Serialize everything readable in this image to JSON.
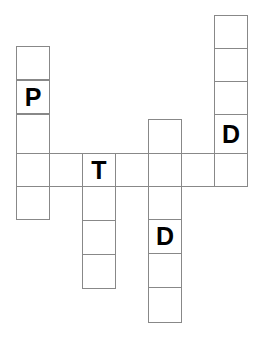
{
  "puzzle": {
    "title": "Crossword Grid",
    "background_color": "#ffffff",
    "cell_border_color": "#888888",
    "cell_fill_color": "#ffffff",
    "letter_color": "#000000",
    "cell_size": 33,
    "canvas": {
      "width": 260,
      "height": 343
    }
  },
  "entries": [
    {
      "name": "down-entry-left-p",
      "direction": "down",
      "length": 5,
      "letters": [
        "",
        "P",
        "",
        "",
        ""
      ],
      "x": 16,
      "y": 46
    },
    {
      "name": "down-entry-top-right-d",
      "direction": "down",
      "length": 5,
      "letters": [
        "",
        "",
        "",
        "D",
        ""
      ],
      "x": 214,
      "y": 15
    },
    {
      "name": "across-entry-main",
      "direction": "across",
      "length": 7,
      "letters": [
        "",
        "",
        "T",
        "",
        "",
        "",
        ""
      ],
      "x": 16,
      "y": 153
    },
    {
      "name": "down-entry-t",
      "direction": "down",
      "length": 4,
      "letters": [
        "T",
        "",
        "",
        ""
      ],
      "x": 82,
      "y": 153
    },
    {
      "name": "down-entry-middle-d",
      "direction": "down",
      "length": 6,
      "letters": [
        "",
        "",
        "",
        "D",
        "",
        ""
      ],
      "x": 148,
      "y": 119
    }
  ],
  "cells": [
    {
      "name": "cell-p-col-r0",
      "letter": "",
      "x": 16,
      "y": 46,
      "w": 34,
      "h": 34
    },
    {
      "name": "cell-p-col-r1",
      "letter": "P",
      "x": 16,
      "y": 80,
      "w": 34,
      "h": 34
    },
    {
      "name": "cell-p-col-r2",
      "letter": "",
      "x": 16,
      "y": 114,
      "w": 34,
      "h": 40
    },
    {
      "name": "cell-p-col-r3",
      "letter": "",
      "x": 16,
      "y": 153,
      "w": 34,
      "h": 34
    },
    {
      "name": "cell-p-col-r4",
      "letter": "",
      "x": 16,
      "y": 186,
      "w": 34,
      "h": 34
    },
    {
      "name": "cell-d-right-r0",
      "letter": "",
      "x": 214,
      "y": 15,
      "w": 34,
      "h": 34
    },
    {
      "name": "cell-d-right-r1",
      "letter": "",
      "x": 214,
      "y": 48,
      "w": 34,
      "h": 34
    },
    {
      "name": "cell-d-right-r2",
      "letter": "",
      "x": 214,
      "y": 81,
      "w": 34,
      "h": 34
    },
    {
      "name": "cell-d-right-r3",
      "letter": "D",
      "x": 214,
      "y": 114,
      "w": 34,
      "h": 40
    },
    {
      "name": "cell-d-right-r4",
      "letter": "",
      "x": 214,
      "y": 153,
      "w": 34,
      "h": 34
    },
    {
      "name": "cell-d-mid-r0",
      "letter": "",
      "x": 148,
      "y": 119,
      "w": 34,
      "h": 35
    },
    {
      "name": "cell-d-mid-r1",
      "letter": "",
      "x": 148,
      "y": 153,
      "w": 34,
      "h": 34
    },
    {
      "name": "cell-d-mid-r2",
      "letter": "",
      "x": 148,
      "y": 186,
      "w": 34,
      "h": 34
    },
    {
      "name": "cell-d-mid-r3",
      "letter": "D",
      "x": 148,
      "y": 219,
      "w": 34,
      "h": 35
    },
    {
      "name": "cell-d-mid-r4",
      "letter": "",
      "x": 148,
      "y": 253,
      "w": 34,
      "h": 35
    },
    {
      "name": "cell-d-mid-r5",
      "letter": "",
      "x": 148,
      "y": 287,
      "w": 34,
      "h": 36
    },
    {
      "name": "cell-t-col-r0",
      "letter": "T",
      "x": 82,
      "y": 153,
      "w": 34,
      "h": 34
    },
    {
      "name": "cell-t-col-r1",
      "letter": "",
      "x": 82,
      "y": 186,
      "w": 34,
      "h": 35
    },
    {
      "name": "cell-t-col-r2",
      "letter": "",
      "x": 82,
      "y": 220,
      "w": 34,
      "h": 35
    },
    {
      "name": "cell-t-col-r3",
      "letter": "",
      "x": 82,
      "y": 254,
      "w": 34,
      "h": 35
    },
    {
      "name": "cell-across-c1",
      "letter": "",
      "x": 49,
      "y": 153,
      "w": 34,
      "h": 34
    },
    {
      "name": "cell-across-c3",
      "letter": "",
      "x": 115,
      "y": 153,
      "w": 34,
      "h": 34
    },
    {
      "name": "cell-across-c5",
      "letter": "",
      "x": 181,
      "y": 153,
      "w": 34,
      "h": 34
    }
  ]
}
